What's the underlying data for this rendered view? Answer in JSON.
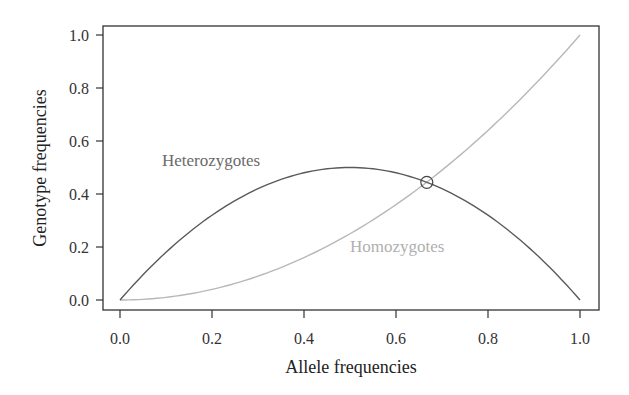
{
  "chart_data": {
    "type": "line",
    "title": "",
    "xlabel": "Allele frequencies",
    "ylabel": "Genotype frequencies",
    "xlim": [
      0.0,
      1.0
    ],
    "ylim": [
      0.0,
      1.0
    ],
    "xticks": [
      "0.0",
      "0.2",
      "0.4",
      "0.6",
      "0.8",
      "1.0"
    ],
    "yticks": [
      "0.0",
      "0.2",
      "0.4",
      "0.6",
      "0.8",
      "1.0"
    ],
    "grid": false,
    "legend": "inline labels",
    "x": [
      0.0,
      0.1,
      0.2,
      0.3,
      0.4,
      0.5,
      0.6,
      0.7,
      0.8,
      0.9,
      1.0
    ],
    "series": [
      {
        "name": "Heterozygotes",
        "formula": "2p(1-p)",
        "color": "#5a5a5a",
        "values": [
          0.0,
          0.18,
          0.32,
          0.42,
          0.48,
          0.5,
          0.48,
          0.42,
          0.32,
          0.18,
          0.0
        ]
      },
      {
        "name": "Homozygotes",
        "formula": "p^2",
        "color": "#b8b8b8",
        "values": [
          0.0,
          0.01,
          0.04,
          0.09,
          0.16,
          0.25,
          0.36,
          0.49,
          0.64,
          0.81,
          1.0
        ]
      }
    ],
    "annotations": [
      {
        "type": "circle-marker",
        "x": 0.667,
        "y": 0.444,
        "note": "intersection of curves"
      }
    ]
  },
  "labels": {
    "heterozygotes": "Heterozygotes",
    "homozygotes": "Homozygotes",
    "xaxis_title": "Allele frequencies",
    "yaxis_title": "Genotype frequencies",
    "xticks": [
      "0.0",
      "0.2",
      "0.4",
      "0.6",
      "0.8",
      "1.0"
    ],
    "yticks": [
      "0.0",
      "0.2",
      "0.4",
      "0.6",
      "0.8",
      "1.0"
    ]
  },
  "colors": {
    "heterozygotes_line": "#5a5a5a",
    "homozygotes_line": "#b8b8b8",
    "heterozygotes_text": "#6a6a6a",
    "homozygotes_text": "#b0b0b0",
    "axis": "#333333"
  }
}
